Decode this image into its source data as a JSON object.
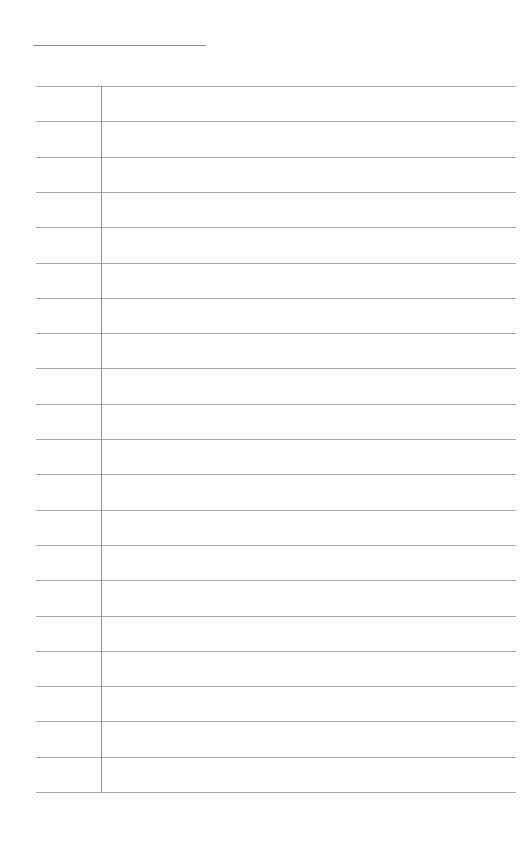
{
  "page": {
    "title_field": "",
    "line_count": 21,
    "first_line_y": 86,
    "line_spacing": 35.3,
    "margin_x": 101,
    "colors": {
      "paper": "#ffffff",
      "rule": "#a9a9a9",
      "margin": "#8f8f8f"
    }
  }
}
